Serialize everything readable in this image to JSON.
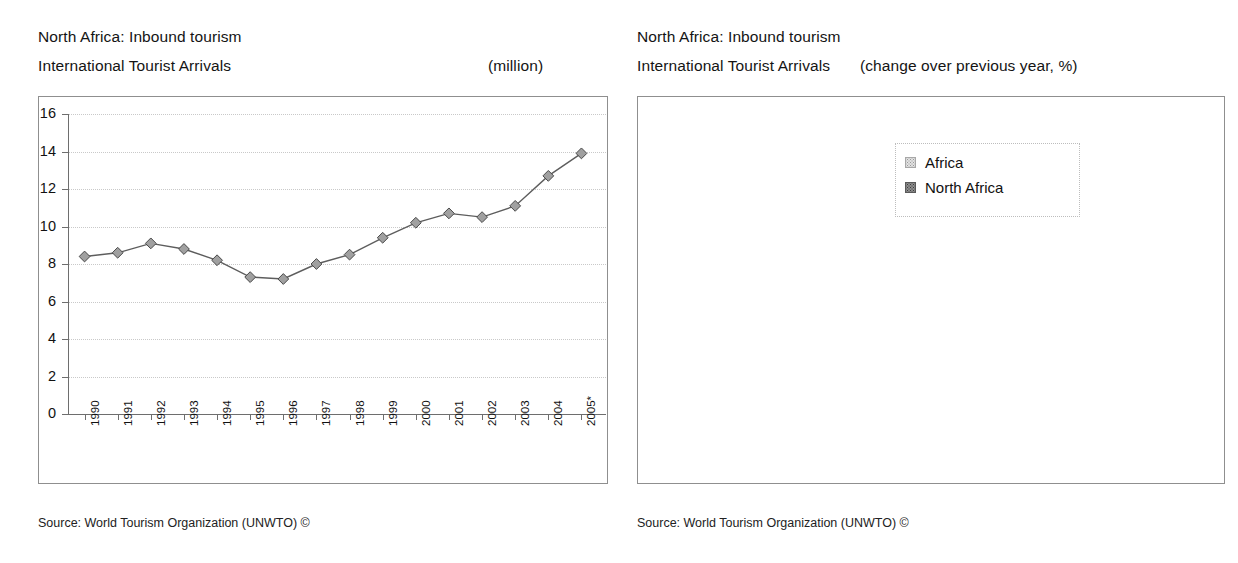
{
  "left_panel": {
    "title_line1": "North Africa: Inbound tourism",
    "title_line2": "International Tourist Arrivals",
    "unit": "(million)",
    "source": "Source: World Tourism Organization (UNWTO) ©"
  },
  "right_panel": {
    "title_line1": "North Africa: Inbound tourism",
    "title_line2": "International Tourist Arrivals",
    "unit": "(change over previous year, %)",
    "source": "Source: World Tourism Organization (UNWTO) ©"
  },
  "chart_data": [
    {
      "type": "line",
      "title": "North Africa: Inbound tourism — International Tourist Arrivals",
      "ylabel": "",
      "xlabel": "",
      "unit": "(million)",
      "ylim": [
        0,
        16
      ],
      "ytick_step": 2,
      "yticks": [
        "16",
        "14",
        "12",
        "10",
        "8",
        "6",
        "4",
        "2",
        "0"
      ],
      "grid": true,
      "legend": "none",
      "marker": "diamond",
      "categories": [
        "1990",
        "1991",
        "1992",
        "1993",
        "1994",
        "1995",
        "1996",
        "1997",
        "1998",
        "1999",
        "2000",
        "2001",
        "2002",
        "2003",
        "2004",
        "2005*"
      ],
      "values": [
        8.4,
        8.6,
        9.1,
        8.8,
        8.2,
        7.3,
        7.2,
        8.0,
        8.5,
        9.4,
        10.2,
        10.7,
        10.5,
        11.1,
        12.7,
        13.9
      ]
    },
    {
      "type": "bar",
      "title": "North Africa: Inbound tourism — International Tourist Arrivals",
      "ylabel": "",
      "xlabel": "",
      "unit": "(change over previous year, %)",
      "ylim": [
        -4,
        16
      ],
      "ytick_step": 2,
      "yticks": [
        "16",
        "14",
        "12",
        "10",
        "8",
        "6",
        "4",
        "2",
        "0",
        "-2",
        "-4"
      ],
      "grid": true,
      "legend_position": "top-center",
      "categories": [
        "96/95",
        "97/96",
        "98/97",
        "99/98",
        "00/99",
        "01/00",
        "02/01",
        "03/02",
        "04/03",
        "05*/04"
      ],
      "series": [
        {
          "name": "Africa",
          "color": "#e2e2e2",
          "values": [
            8.7,
            4.5,
            10.6,
            6.0,
            4.3,
            3.2,
            3.6,
            5.3,
            9.1,
            9.0
          ],
          "labels": [
            "8.7",
            "4.5",
            "10.6",
            "6.0",
            "4.3",
            "3.2",
            "3.6",
            "5.3",
            "9.1",
            "9.0"
          ]
        },
        {
          "name": "North Africa",
          "color": "#8d8d8d",
          "values": [
            -0.7,
            10.8,
            6.6,
            10.7,
            8.5,
            4.7,
            -1.5,
            5.1,
            15.1,
            8.9
          ],
          "labels": [
            "-0.7",
            "10.8",
            "6.6",
            "10.7",
            "8.5",
            "4.7",
            "-1.5",
            "5.1",
            "15.1",
            "8.9"
          ]
        }
      ]
    }
  ]
}
